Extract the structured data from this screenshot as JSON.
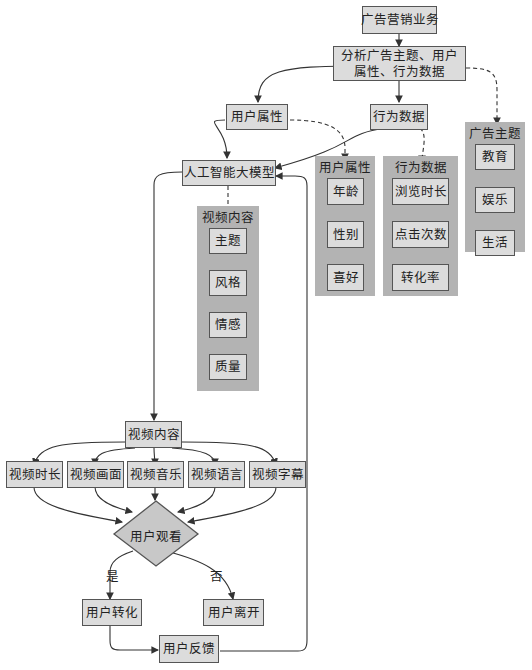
{
  "diagram": {
    "root": "广告营销业务",
    "analyze": "分析广告主题、用户属性、行为数据",
    "analyze_line1": "分析广告主题、用户",
    "analyze_line2": "属性、行为数据",
    "user_attr": "用户属性",
    "behavior": "行为数据",
    "ai_model": "人工智能大模型",
    "groups": {
      "ad_theme": {
        "title": "广告主题",
        "items": [
          "教育",
          "娱乐",
          "生活"
        ]
      },
      "user_attr": {
        "title": "用户属性",
        "items": [
          "年龄",
          "性别",
          "喜好"
        ]
      },
      "behavior": {
        "title": "行为数据",
        "items": [
          "浏览时长",
          "点击次数",
          "转化率"
        ]
      },
      "video_content": {
        "title": "视频内容",
        "items": [
          "主题",
          "风格",
          "情感",
          "质量"
        ]
      }
    },
    "video_content": "视频内容",
    "video_aspects": [
      "视频时长",
      "视频画面",
      "视频音乐",
      "视频语言",
      "视频字幕"
    ],
    "decision": "用户观看",
    "yes_label": "是",
    "no_label": "否",
    "convert": "用户转化",
    "leave": "用户离开",
    "feedback": "用户反馈",
    "colors": {
      "box_fill": "#dcdcdc",
      "group_fill": "#b3b3b3",
      "border": "#555555",
      "edge": "#333333"
    }
  }
}
